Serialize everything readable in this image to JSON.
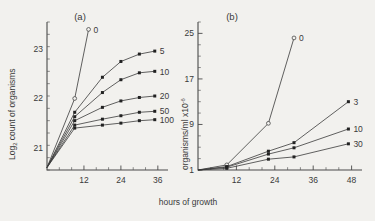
{
  "figure": {
    "shared_xlabel": "hours of growth",
    "background_color": "#f2f1ee",
    "ink_color": "#3a3a3a"
  },
  "panel_a": {
    "label": "(a)",
    "ylabel_main": "Log",
    "ylabel_sub": "2",
    "ylabel_rest": " count of organisms",
    "ytick_labels": [
      "21",
      "22",
      "23"
    ],
    "ytick_values": [
      21,
      22,
      23
    ],
    "xtick_labels": [
      "12",
      "24",
      "36"
    ],
    "xtick_values": [
      12,
      24,
      36
    ],
    "xlim": [
      0,
      38
    ],
    "ylim": [
      20.55,
      23.55
    ],
    "series_labels": [
      "0",
      "5",
      "10",
      "20",
      "50",
      "100"
    ]
  },
  "panel_b": {
    "label": "(b)",
    "ylabel_main": "organisms/ml x10",
    "ylabel_sup": "-6",
    "ytick_labels": [
      "1",
      "9",
      "17",
      "25"
    ],
    "ytick_values": [
      1,
      9,
      17,
      25
    ],
    "xtick_labels": [
      "12",
      "24",
      "36",
      "48"
    ],
    "xtick_values": [
      12,
      24,
      36,
      48
    ],
    "xlim": [
      0,
      50
    ],
    "ylim": [
      1,
      27
    ],
    "series_labels": [
      "0",
      "3",
      "10",
      "30"
    ]
  },
  "chart_data": [
    {
      "type": "line",
      "panel": "(a)",
      "title": "",
      "xlabel": "hours of growth",
      "ylabel": "Log2 count of organisms",
      "xlim": [
        0,
        38
      ],
      "ylim": [
        20.55,
        23.55
      ],
      "xticks": [
        12,
        24,
        36
      ],
      "yticks": [
        21,
        22,
        23
      ],
      "grid": false,
      "legend": "right-of-curve-endpoints",
      "series": [
        {
          "name": "0",
          "marker": "open-circle",
          "x": [
            0,
            9,
            13.5
          ],
          "values": [
            20.6,
            22.0,
            23.4
          ]
        },
        {
          "name": "5",
          "marker": "filled-square",
          "x": [
            0,
            9,
            18,
            24,
            30,
            35
          ],
          "values": [
            20.6,
            21.72,
            22.43,
            22.75,
            22.9,
            22.96
          ]
        },
        {
          "name": "10",
          "marker": "filled-square",
          "x": [
            0,
            9,
            18,
            24,
            30,
            35
          ],
          "values": [
            20.6,
            21.63,
            22.12,
            22.38,
            22.52,
            22.55
          ]
        },
        {
          "name": "20",
          "marker": "filled-square",
          "x": [
            0,
            9,
            18,
            24,
            30,
            35
          ],
          "values": [
            20.6,
            21.55,
            21.82,
            21.95,
            22.02,
            22.05
          ]
        },
        {
          "name": "50",
          "marker": "filled-square",
          "x": [
            0,
            9,
            18,
            24,
            30,
            35
          ],
          "values": [
            20.6,
            21.46,
            21.58,
            21.65,
            21.72,
            21.74
          ]
        },
        {
          "name": "100",
          "marker": "filled-square",
          "x": [
            0,
            9,
            18,
            24,
            30,
            35
          ],
          "values": [
            20.6,
            21.4,
            21.46,
            21.5,
            21.55,
            21.57
          ]
        }
      ]
    },
    {
      "type": "line",
      "panel": "(b)",
      "title": "",
      "xlabel": "hours of growth",
      "ylabel": "organisms/ml x10-6",
      "xlim": [
        0,
        50
      ],
      "ylim": [
        1,
        27
      ],
      "xticks": [
        12,
        24,
        36,
        48
      ],
      "yticks": [
        1,
        9,
        17,
        25
      ],
      "grid": false,
      "legend": "right-of-curve-endpoints",
      "series": [
        {
          "name": "0",
          "marker": "open-circle",
          "x": [
            0,
            9,
            22,
            30
          ],
          "values": [
            1.0,
            1.9,
            9.2,
            24.2
          ]
        },
        {
          "name": "3",
          "marker": "filled-square",
          "x": [
            0,
            9,
            22,
            30,
            47
          ],
          "values": [
            1.0,
            1.6,
            4.3,
            5.8,
            13.0
          ]
        },
        {
          "name": "10",
          "marker": "filled-square",
          "x": [
            0,
            9,
            22,
            30,
            47
          ],
          "values": [
            1.0,
            1.5,
            3.8,
            4.9,
            8.2
          ]
        },
        {
          "name": "30",
          "marker": "filled-square",
          "x": [
            0,
            9,
            22,
            30,
            47
          ],
          "values": [
            1.0,
            1.3,
            2.9,
            3.3,
            5.6
          ]
        }
      ]
    }
  ]
}
